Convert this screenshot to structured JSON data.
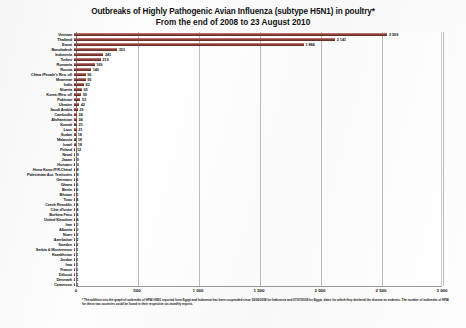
{
  "chart_data": {
    "type": "bar",
    "orientation": "horizontal",
    "title": "Outbreaks of Highly Pathogenic Avian Influenza (subtype H5N1) in poultry*",
    "subtitle": "From the end of 2008 to 23 August 2010",
    "xlabel": "",
    "ylabel": "",
    "xlim": [
      0,
      3000
    ],
    "xticks": [
      "0",
      "500",
      "1 000",
      "1 500",
      "2 000",
      "2 500",
      "3 000"
    ],
    "xtick_values": [
      0,
      500,
      1000,
      1500,
      2000,
      2500,
      3000
    ],
    "grid": true,
    "legend": "none",
    "bar_color": "#8a443e",
    "categories": [
      "Vietnam",
      "Thailand",
      "Egypt",
      "Bangladesh",
      "Indonesia",
      "Turkey",
      "Romania",
      "Russia",
      "China (People's Rep. of)",
      "Myanmar",
      "India",
      "Nigeria",
      "Korea (Rep. of)",
      "Pakistan",
      "Ukraine",
      "Saudi Arabia",
      "Cambodia",
      "Afghanistan",
      "Kuwait",
      "Laos",
      "Sudan",
      "Malaysia",
      "Israel",
      "Poland",
      "Nepal",
      "Japan",
      "Hungary",
      "Hong Kong (P.R.China)",
      "Palestinian Aut. Territories",
      "Germany",
      "Ghana",
      "Benin",
      "Bhutan",
      "Togo",
      "Czech Republic",
      "Côte d'Ivoire",
      "Burkina Faso",
      "United Kingdom",
      "Iran",
      "Albania",
      "Niger",
      "Azerbaijan",
      "Sweden",
      "Serbia & Montenegro",
      "Kazakhstan",
      "Jordan",
      "Iraq",
      "France",
      "Djibouti",
      "Denmark",
      "Cameroon"
    ],
    "values": [
      2569,
      2141,
      1884,
      353,
      241,
      219,
      169,
      140,
      96,
      95,
      82,
      65,
      59,
      53,
      42,
      29,
      24,
      24,
      23,
      21,
      18,
      18,
      18,
      12,
      9,
      9,
      9,
      8,
      8,
      6,
      6,
      6,
      5,
      4,
      4,
      4,
      4,
      4,
      3,
      3,
      2,
      2,
      2,
      1,
      1,
      1,
      1,
      1,
      1,
      1,
      1
    ],
    "value_labels": [
      "2 569",
      "2 141",
      "1 884",
      "353",
      "241",
      "219",
      "169",
      "140",
      "96",
      "95",
      "82",
      "65",
      "59",
      "53",
      "42",
      "29",
      "24",
      "24",
      "23",
      "21",
      "18",
      "18",
      "18",
      "12",
      "9",
      "9",
      "9",
      "8",
      "8",
      "6",
      "6",
      "6",
      "5",
      "4",
      "4",
      "4",
      "4",
      "4",
      "3",
      "3",
      "2",
      "2",
      "2",
      "1",
      "1",
      "1",
      "1",
      "1",
      "1",
      "1",
      "1"
    ]
  },
  "footnote": "* The addition into the graph of outbreaks of HPAI H5N1 reported from Egypt and Indonesia has been suspended since 30/06/2008 for Indonesia and 07/07/2008 for Egypt, dates for which they declared the disease as endemic. The number of outbreaks of HPAI for these two countries could be found in their respective six-monthly reports."
}
